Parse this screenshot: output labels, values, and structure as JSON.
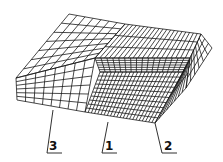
{
  "diagram": {
    "type": "3d-mesh-block",
    "labels": [
      {
        "id": "3",
        "text": "3",
        "x": 48,
        "y": 146
      },
      {
        "id": "1",
        "text": "1",
        "x": 103,
        "y": 146
      },
      {
        "id": "2",
        "text": "2",
        "x": 163,
        "y": 146
      }
    ],
    "colors": {
      "line": "#1a1a1a",
      "background": "#ffffff"
    }
  }
}
